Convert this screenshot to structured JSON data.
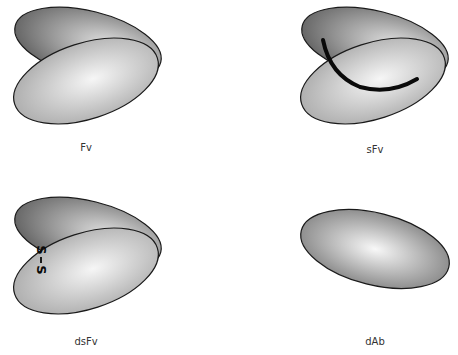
{
  "panels": [
    {
      "id": "fv",
      "label": "Fv",
      "lobes": 2,
      "marker": "none"
    },
    {
      "id": "sfv",
      "label": "sFv",
      "lobes": 2,
      "marker": "linker-arc"
    },
    {
      "id": "dsfv",
      "label": "dsFv",
      "lobes": 2,
      "marker": "disulfide-bond",
      "marker_text": "S–S"
    },
    {
      "id": "dab",
      "label": "dAb",
      "lobes": 1,
      "marker": "none"
    }
  ],
  "colors": {
    "outline": "#1a1a1a",
    "shade_light": "#f4f4f4",
    "shade_dark": "#6e6e6e",
    "linker": "#0a0a0a"
  }
}
